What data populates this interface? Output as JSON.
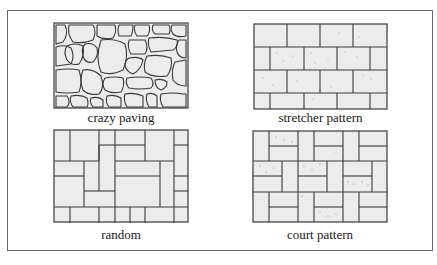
{
  "figure": {
    "panels": [
      {
        "id": "crazy-paving",
        "label": "crazy paving"
      },
      {
        "id": "stretcher-pattern",
        "label": "stretcher pattern"
      },
      {
        "id": "random",
        "label": "random"
      },
      {
        "id": "court-pattern",
        "label": "court pattern"
      }
    ]
  },
  "colors": {
    "stroke": "#3a3a3a",
    "fill": "#ececec",
    "frame": "#6a6a6a",
    "speckle": "#8a8a8a"
  }
}
